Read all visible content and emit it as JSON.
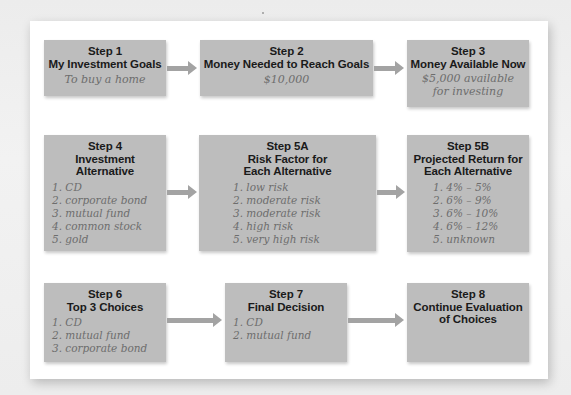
{
  "diagram": {
    "rows": [
      {
        "steps": [
          {
            "id": "step1",
            "title_lines": [
              "Step 1",
              "My Investment Goals"
            ],
            "content_lines": [
              "To buy a home"
            ]
          },
          {
            "id": "step2",
            "title_lines": [
              "Step 2",
              "Money Needed to Reach Goals"
            ],
            "content_lines": [
              "$10,000"
            ]
          },
          {
            "id": "step3",
            "title_lines": [
              "Step 3",
              "Money Available Now"
            ],
            "content_lines": [
              "$5,000 available",
              "for investing"
            ]
          }
        ]
      },
      {
        "steps": [
          {
            "id": "step4",
            "title_lines": [
              "Step 4",
              "Investment",
              "Alternative"
            ],
            "list": [
              "1. CD",
              "2. corporate bond",
              "3. mutual fund",
              "4. common stock",
              "5. gold"
            ]
          },
          {
            "id": "step5a",
            "title_lines": [
              "Step 5A",
              "Risk Factor for",
              "Each Alternative"
            ],
            "list": [
              "1. low risk",
              "2. moderate risk",
              "3. moderate risk",
              "4. high risk",
              "5. very high risk"
            ]
          },
          {
            "id": "step5b",
            "title_lines": [
              "Step 5B",
              "Projected Return for",
              "Each Alternative"
            ],
            "list": [
              "1. 4% – 5%",
              "2. 6% – 9%",
              "3. 6% – 10%",
              "4. 6% – 12%",
              "5. unknown"
            ]
          }
        ]
      },
      {
        "steps": [
          {
            "id": "step6",
            "title_lines": [
              "Step 6",
              "Top 3 Choices"
            ],
            "list": [
              "1. CD",
              "2. mutual fund",
              "3. corporate bond"
            ]
          },
          {
            "id": "step7",
            "title_lines": [
              "Step 7",
              "Final Decision"
            ],
            "list": [
              "1. CD",
              "2. mutual fund"
            ]
          },
          {
            "id": "step8",
            "title_lines": [
              "Step 8",
              "Continue Evaluation",
              "of Choices"
            ]
          }
        ]
      }
    ],
    "colors": {
      "box_fill": "#bdbdbd",
      "title_text": "#1a1a1a",
      "handwritten_text": "#6d6d6d",
      "arrow": "#a3a3a3",
      "panel": "#ffffff"
    }
  }
}
